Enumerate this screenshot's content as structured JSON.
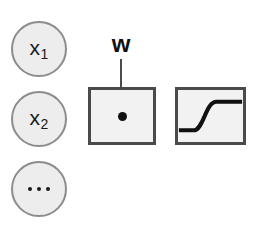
{
  "diagram": {
    "colors": {
      "node_fill": "#ededed",
      "node_stroke": "#8c8c8c",
      "box_fill": "#f2f2f2",
      "box_stroke": "#4a4a4a",
      "ink": "#111111",
      "background": "#ffffff"
    },
    "inputs": [
      {
        "id": "x1",
        "base": "x",
        "subscript": "1",
        "type": "labeled"
      },
      {
        "id": "x2",
        "base": "x",
        "subscript": "2",
        "type": "labeled"
      },
      {
        "id": "more",
        "base": "",
        "subscript": "",
        "type": "ellipsis",
        "dot_count": 3
      }
    ],
    "weight": {
      "label": "w",
      "points_to": "sum-box"
    },
    "blocks": [
      {
        "id": "sum-box",
        "symbol": "dot",
        "meaning": "dot-product / weighted-sum"
      },
      {
        "id": "act-box",
        "symbol": "sigmoid-curve",
        "meaning": "activation-function"
      }
    ]
  }
}
